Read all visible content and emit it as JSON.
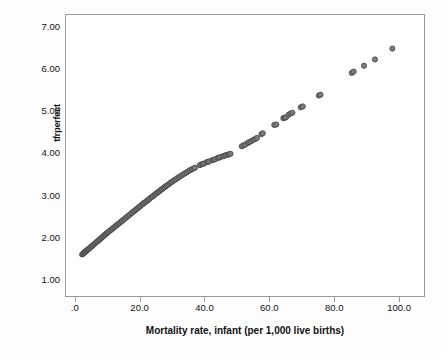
{
  "chart_data": {
    "type": "scatter",
    "title": "",
    "xlabel": "Mortality rate, infant (per 1,000 live births)",
    "ylabel": "tfrperfect",
    "xlim": [
      -3.0,
      108.0
    ],
    "ylim": [
      0.6,
      7.3
    ],
    "xticks": [
      0,
      20,
      40,
      60,
      80,
      100
    ],
    "xticklabels": [
      ".0",
      "20.0",
      "40.0",
      "60.0",
      "80.0",
      "100.0"
    ],
    "yticks": [
      1,
      2,
      3,
      4,
      5,
      6,
      7
    ],
    "yticklabels": [
      "1.00",
      "2.00",
      "3.00",
      "4.00",
      "5.00",
      "6.00",
      "7.00"
    ],
    "grid": false,
    "legend": null,
    "marker": {
      "shape": "circle",
      "fill_color": "#7c7c7c",
      "edge_color": "#4a4a4a",
      "size_px": 5.2
    },
    "series": [
      {
        "name": "tfrperfect vs infant mortality",
        "points": [
          [
            2.0,
            1.59
          ],
          [
            2.2,
            1.6
          ],
          [
            2.4,
            1.62
          ],
          [
            2.6,
            1.63
          ],
          [
            2.8,
            1.64
          ],
          [
            3.0,
            1.66
          ],
          [
            3.2,
            1.67
          ],
          [
            3.4,
            1.68
          ],
          [
            3.6,
            1.7
          ],
          [
            3.8,
            1.71
          ],
          [
            4.0,
            1.72
          ],
          [
            4.3,
            1.74
          ],
          [
            4.6,
            1.76
          ],
          [
            4.9,
            1.78
          ],
          [
            5.2,
            1.8
          ],
          [
            5.5,
            1.82
          ],
          [
            5.8,
            1.84
          ],
          [
            6.1,
            1.86
          ],
          [
            6.4,
            1.88
          ],
          [
            6.7,
            1.9
          ],
          [
            7.0,
            1.92
          ],
          [
            7.3,
            1.94
          ],
          [
            7.6,
            1.96
          ],
          [
            7.9,
            1.98
          ],
          [
            8.2,
            2.0
          ],
          [
            8.5,
            2.02
          ],
          [
            8.8,
            2.04
          ],
          [
            9.1,
            2.06
          ],
          [
            9.4,
            2.08
          ],
          [
            9.7,
            2.1
          ],
          [
            10.0,
            2.12
          ],
          [
            10.4,
            2.14
          ],
          [
            10.8,
            2.17
          ],
          [
            11.2,
            2.19
          ],
          [
            11.6,
            2.22
          ],
          [
            12.0,
            2.24
          ],
          [
            12.4,
            2.27
          ],
          [
            12.8,
            2.29
          ],
          [
            13.2,
            2.32
          ],
          [
            13.6,
            2.34
          ],
          [
            14.0,
            2.37
          ],
          [
            14.4,
            2.39
          ],
          [
            14.8,
            2.42
          ],
          [
            15.2,
            2.44
          ],
          [
            15.6,
            2.47
          ],
          [
            16.0,
            2.49
          ],
          [
            16.4,
            2.52
          ],
          [
            16.8,
            2.54
          ],
          [
            17.2,
            2.57
          ],
          [
            17.6,
            2.59
          ],
          [
            18.0,
            2.62
          ],
          [
            18.4,
            2.64
          ],
          [
            18.8,
            2.67
          ],
          [
            19.2,
            2.69
          ],
          [
            19.6,
            2.72
          ],
          [
            20.0,
            2.74
          ],
          [
            20.4,
            2.77
          ],
          [
            20.8,
            2.79
          ],
          [
            21.2,
            2.82
          ],
          [
            21.6,
            2.84
          ],
          [
            22.0,
            2.86
          ],
          [
            22.4,
            2.89
          ],
          [
            22.8,
            2.91
          ],
          [
            23.2,
            2.94
          ],
          [
            23.6,
            2.96
          ],
          [
            24.0,
            2.98
          ],
          [
            24.4,
            3.01
          ],
          [
            24.8,
            3.03
          ],
          [
            25.2,
            3.06
          ],
          [
            25.6,
            3.08
          ],
          [
            26.0,
            3.1
          ],
          [
            26.4,
            3.13
          ],
          [
            26.8,
            3.15
          ],
          [
            27.2,
            3.17
          ],
          [
            27.6,
            3.2
          ],
          [
            28.0,
            3.22
          ],
          [
            28.4,
            3.24
          ],
          [
            28.8,
            3.26
          ],
          [
            29.2,
            3.29
          ],
          [
            29.6,
            3.31
          ],
          [
            30.0,
            3.33
          ],
          [
            30.5,
            3.36
          ],
          [
            31.0,
            3.38
          ],
          [
            31.5,
            3.41
          ],
          [
            32.0,
            3.43
          ],
          [
            32.5,
            3.46
          ],
          [
            33.0,
            3.48
          ],
          [
            33.5,
            3.51
          ],
          [
            34.0,
            3.53
          ],
          [
            34.5,
            3.55
          ],
          [
            35.0,
            3.58
          ],
          [
            35.5,
            3.6
          ],
          [
            36.0,
            3.62
          ],
          [
            36.5,
            3.64
          ],
          [
            37.0,
            3.66
          ],
          [
            38.5,
            3.72
          ],
          [
            39.0,
            3.74
          ],
          [
            39.4,
            3.75
          ],
          [
            39.8,
            3.76
          ],
          [
            40.6,
            3.79
          ],
          [
            41.0,
            3.8
          ],
          [
            41.4,
            3.81
          ],
          [
            42.4,
            3.84
          ],
          [
            42.8,
            3.85
          ],
          [
            43.2,
            3.86
          ],
          [
            44.0,
            3.89
          ],
          [
            44.4,
            3.9
          ],
          [
            44.8,
            3.91
          ],
          [
            45.6,
            3.93
          ],
          [
            46.0,
            3.94
          ],
          [
            46.6,
            3.96
          ],
          [
            47.2,
            3.97
          ],
          [
            47.6,
            3.98
          ],
          [
            48.0,
            3.99
          ],
          [
            51.5,
            4.17
          ],
          [
            52.0,
            4.19
          ],
          [
            52.6,
            4.21
          ],
          [
            53.4,
            4.25
          ],
          [
            53.8,
            4.27
          ],
          [
            54.4,
            4.29
          ],
          [
            55.0,
            4.32
          ],
          [
            55.6,
            4.34
          ],
          [
            56.2,
            4.37
          ],
          [
            57.6,
            4.46
          ],
          [
            58.0,
            4.48
          ],
          [
            61.6,
            4.68
          ],
          [
            62.2,
            4.69
          ],
          [
            64.4,
            4.84
          ],
          [
            64.8,
            4.85
          ],
          [
            65.2,
            4.86
          ],
          [
            66.0,
            4.92
          ],
          [
            66.6,
            4.95
          ],
          [
            67.2,
            4.97
          ],
          [
            69.8,
            5.1
          ],
          [
            70.4,
            5.12
          ],
          [
            75.4,
            5.38
          ],
          [
            75.9,
            5.4
          ],
          [
            85.6,
            5.92
          ],
          [
            86.2,
            5.95
          ],
          [
            89.4,
            6.09
          ],
          [
            92.8,
            6.24
          ],
          [
            98.2,
            6.5
          ]
        ]
      }
    ]
  }
}
